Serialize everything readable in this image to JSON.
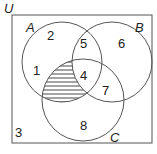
{
  "diagram": {
    "type": "venn",
    "universe_label": "U",
    "sets": [
      {
        "name": "A",
        "cx": 62,
        "cy": 62,
        "r": 40
      },
      {
        "name": "B",
        "cx": 112,
        "cy": 62,
        "r": 40
      },
      {
        "name": "C",
        "cx": 83,
        "cy": 100,
        "r": 41
      }
    ],
    "regions": [
      {
        "id": "A_only",
        "value": "2"
      },
      {
        "id": "A_and_B_only",
        "value": "5"
      },
      {
        "id": "B_only",
        "value": "6"
      },
      {
        "id": "A_not_B_not_C_left",
        "value": "1"
      },
      {
        "id": "A_and_B_and_C",
        "value": "4"
      },
      {
        "id": "B_and_C_only",
        "value": "7"
      },
      {
        "id": "C_only",
        "value": "8"
      },
      {
        "id": "outside",
        "value": "3"
      }
    ],
    "shaded_region": "A ∩ C ∩ B'",
    "colors": {
      "stroke": "#555555",
      "hatch": "#333333",
      "background": "#ffffff"
    }
  }
}
